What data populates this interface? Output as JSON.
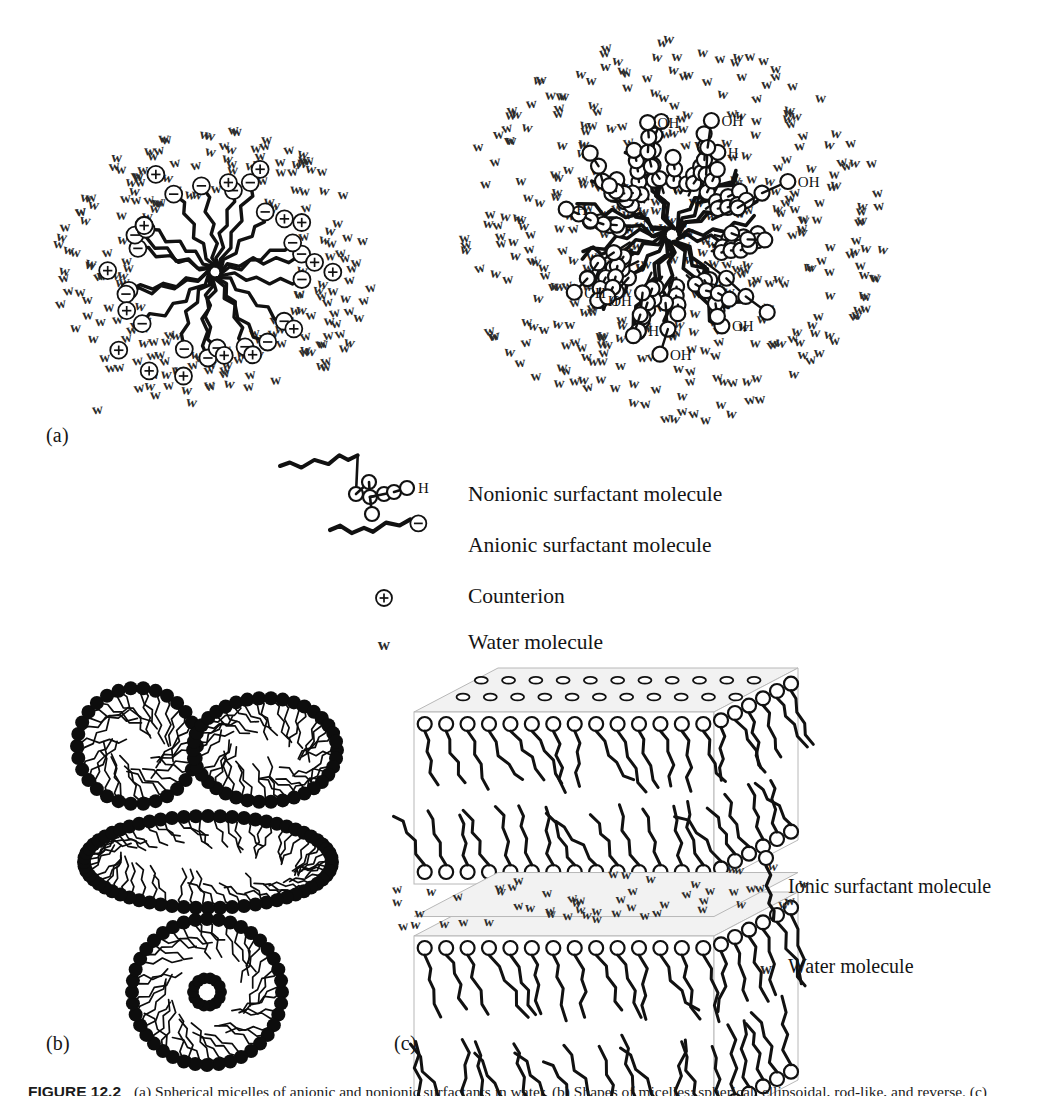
{
  "figure": {
    "caption_number": "FIGURE 12.2",
    "caption_text": "(a) Spherical micelles of anionic and nonionic surfactants in water. (b) Shapes of micelles: spherical, ellipsoidal, rod-like, and reverse. (c) Lamellar bilayer structure of ionic surfactant separated by water layers.",
    "panels": [
      {
        "id": "a",
        "label": "(a)",
        "x": 46,
        "y": 424
      },
      {
        "id": "b",
        "label": "(b)",
        "x": 46,
        "y": 1032
      },
      {
        "id": "c",
        "label": "(c)",
        "x": 394,
        "y": 1032
      }
    ]
  },
  "legend_middle": {
    "items": [
      {
        "symbol": "nonionic-surfactant-glyph",
        "label": "Nonionic surfactant molecule",
        "text_x": 196,
        "text_y": 44
      },
      {
        "symbol": "anionic-surfactant-glyph",
        "label": "Anionic surfactant molecule",
        "text_x": 196,
        "text_y": 95
      },
      {
        "symbol": "counterion-glyph",
        "label": "Counterion",
        "text_x": 196,
        "text_y": 146
      },
      {
        "symbol": "water-glyph",
        "label": "Water molecule",
        "text_x": 196,
        "text_y": 192
      }
    ],
    "terminal_atom": "H"
  },
  "legend_right": {
    "items": [
      {
        "symbol": "ionic-surfactant-glyph",
        "label": "Ionic surfactant molecule",
        "text_x": 36,
        "text_y": 40
      },
      {
        "symbol": "water-glyph",
        "label": "Water molecule",
        "text_x": 36,
        "text_y": 120
      }
    ]
  },
  "glyphs": {
    "water": "w",
    "counterion_charge": "+",
    "anionic_charge": "−",
    "hydroxyl": "OH",
    "hydrogen": "H"
  },
  "colors": {
    "ink": "#111111",
    "water_ink": "#2b2b2b",
    "head_fill": "#ffffff",
    "head_stroke": "#111111",
    "solid_head": "#0d0d0d",
    "box_face": "#f2f2f2",
    "box_edge": "#b8b8b8",
    "background": "#ffffff"
  },
  "panel_a": {
    "anionic_micelle": {
      "name": "anionic-micelle",
      "cx": 215,
      "cy": 272,
      "water_field": {
        "rx": 160,
        "ry": 140,
        "count": 210,
        "seed": 17,
        "font_size": 15
      },
      "core": {
        "radius": 72,
        "chains": 20,
        "segments": 7,
        "seed": 91
      },
      "head_count": 20,
      "head_radius": 8.5,
      "counterions": {
        "count": 17,
        "radius": 8.5,
        "ring_min": 86,
        "ring_max": 132,
        "seed": 44
      }
    },
    "nonionic_micelle": {
      "name": "nonionic-micelle",
      "cx": 672,
      "cy": 235,
      "water_field": {
        "rx": 215,
        "ry": 193,
        "count": 380,
        "seed": 23,
        "font_size": 15
      },
      "core": {
        "radius": 78,
        "chains": 22,
        "segments": 7,
        "seed": 57
      },
      "corona": {
        "arms": 34,
        "beads_min": 3,
        "beads_max": 5,
        "bead_radius": 7.5,
        "reach_min": 34,
        "reach_max": 86,
        "seed": 131
      },
      "oh_labels": 13
    }
  },
  "panel_b": {
    "shapes": [
      {
        "name": "spherical-micelle",
        "type": "sphere",
        "cx": 137,
        "cy": 746,
        "rx": 60,
        "ry": 58,
        "heads": 30,
        "tails": 30,
        "seed": 5
      },
      {
        "name": "ellipsoidal-micelle",
        "type": "ellipse",
        "cx": 265,
        "cy": 750,
        "rx": 72,
        "ry": 52,
        "heads": 38,
        "tails": 38,
        "seed": 11
      },
      {
        "name": "rodlike-micelle",
        "type": "rod",
        "cx": 208,
        "cy": 862,
        "rx": 124,
        "ry": 46,
        "heads": 64,
        "tails": 60,
        "seed": 19
      },
      {
        "name": "reverse-micelle",
        "type": "reverse",
        "cx": 207,
        "cy": 992,
        "rx": 75,
        "ry": 73,
        "heads": 40,
        "tails": 40,
        "inner": 14,
        "seed": 29
      }
    ],
    "head_radius": 7
  },
  "panel_c": {
    "name": "lamellar-bilayer-diagram",
    "origin_x": 414,
    "origin_y": 712,
    "width": 300,
    "depth_x": 84,
    "depth_y": -44,
    "slabs": [
      {
        "name": "upper-bilayer",
        "y": 0,
        "height": 172,
        "top_heads": 22,
        "front_columns": 14,
        "side_columns": 6
      },
      {
        "name": "lower-bilayer",
        "y": 224,
        "height": 188,
        "top_heads": 0,
        "front_columns": 14,
        "side_columns": 6
      }
    ],
    "water_layer": {
      "name": "interlamellar-water",
      "y": 176,
      "height": 46,
      "count": 52,
      "seed": 71,
      "font_size": 14
    }
  }
}
